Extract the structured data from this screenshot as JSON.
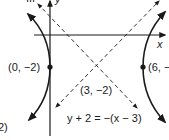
{
  "figure": {
    "axes": {
      "x_label": "x",
      "y_label": "y"
    },
    "center": {
      "label": "(3, −2)",
      "x": 3,
      "y": -2
    },
    "vertices": [
      {
        "label": "(0, −2)",
        "x": 0,
        "y": -2
      },
      {
        "label": "(6, −",
        "x": 6,
        "y": -2
      }
    ],
    "asymptotes": [
      {
        "equation": "y + 2 = −(x − 3)",
        "slope": -1
      },
      {
        "equation": "",
        "slope": 1
      }
    ],
    "partial_text": {
      "top_left": "III",
      "bottom_left": "2)"
    },
    "colors": {
      "ink": "#1a1a1a",
      "background": "#ffffff"
    }
  }
}
